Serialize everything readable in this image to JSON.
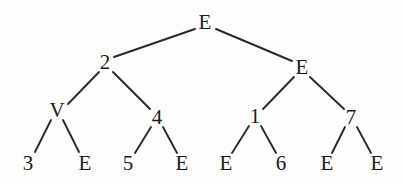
{
  "figure": {
    "type": "binary-tree-diagram",
    "width": 404,
    "height": 185,
    "background_color": "#fdfdfc",
    "ink_color": "#1b1b1b",
    "edge_color": "#2a2a2a"
  },
  "nodes": [
    {
      "id": "n0",
      "label": "E",
      "x": 205,
      "y": 22,
      "depth": 0
    },
    {
      "id": "n1",
      "label": "2",
      "x": 105,
      "y": 62,
      "depth": 1
    },
    {
      "id": "n2",
      "label": "E",
      "x": 302,
      "y": 67,
      "depth": 1
    },
    {
      "id": "n3",
      "label": "V",
      "x": 57,
      "y": 110,
      "depth": 2
    },
    {
      "id": "n4",
      "label": "4",
      "x": 157,
      "y": 117,
      "depth": 2
    },
    {
      "id": "n5",
      "label": "1",
      "x": 255,
      "y": 116,
      "depth": 2
    },
    {
      "id": "n6",
      "label": "7",
      "x": 351,
      "y": 117,
      "depth": 2
    },
    {
      "id": "n7",
      "label": "3",
      "x": 28,
      "y": 163,
      "depth": 3
    },
    {
      "id": "n8",
      "label": "E",
      "x": 85,
      "y": 163,
      "depth": 3
    },
    {
      "id": "n9",
      "label": "5",
      "x": 128,
      "y": 163,
      "depth": 3
    },
    {
      "id": "n10",
      "label": "E",
      "x": 182,
      "y": 163,
      "depth": 3
    },
    {
      "id": "n11",
      "label": "E",
      "x": 226,
      "y": 163,
      "depth": 3
    },
    {
      "id": "n12",
      "label": "6",
      "x": 281,
      "y": 163,
      "depth": 3
    },
    {
      "id": "n13",
      "label": "E",
      "x": 327,
      "y": 163,
      "depth": 3
    },
    {
      "id": "n14",
      "label": "E",
      "x": 377,
      "y": 163,
      "depth": 3
    }
  ],
  "edges": [
    {
      "from": "n0",
      "to": "n1",
      "x1": 195,
      "y1": 29,
      "x2": 114,
      "y2": 57
    },
    {
      "from": "n0",
      "to": "n2",
      "x1": 216,
      "y1": 29,
      "x2": 292,
      "y2": 61
    },
    {
      "from": "n1",
      "to": "n3",
      "x1": 99,
      "y1": 72,
      "x2": 68,
      "y2": 104
    },
    {
      "from": "n1",
      "to": "n4",
      "x1": 113,
      "y1": 72,
      "x2": 150,
      "y2": 109
    },
    {
      "from": "n2",
      "to": "n5",
      "x1": 294,
      "y1": 77,
      "x2": 263,
      "y2": 109
    },
    {
      "from": "n2",
      "to": "n6",
      "x1": 310,
      "y1": 77,
      "x2": 344,
      "y2": 109
    },
    {
      "from": "n3",
      "to": "n7",
      "x1": 51,
      "y1": 120,
      "x2": 35,
      "y2": 152
    },
    {
      "from": "n3",
      "to": "n8",
      "x1": 63,
      "y1": 120,
      "x2": 79,
      "y2": 152
    },
    {
      "from": "n4",
      "to": "n9",
      "x1": 151,
      "y1": 127,
      "x2": 135,
      "y2": 153
    },
    {
      "from": "n4",
      "to": "n10",
      "x1": 163,
      "y1": 127,
      "x2": 177,
      "y2": 153
    },
    {
      "from": "n5",
      "to": "n11",
      "x1": 249,
      "y1": 126,
      "x2": 232,
      "y2": 153
    },
    {
      "from": "n5",
      "to": "n12",
      "x1": 261,
      "y1": 126,
      "x2": 276,
      "y2": 153
    },
    {
      "from": "n6",
      "to": "n13",
      "x1": 345,
      "y1": 127,
      "x2": 332,
      "y2": 153
    },
    {
      "from": "n6",
      "to": "n14",
      "x1": 357,
      "y1": 127,
      "x2": 371,
      "y2": 153
    }
  ]
}
